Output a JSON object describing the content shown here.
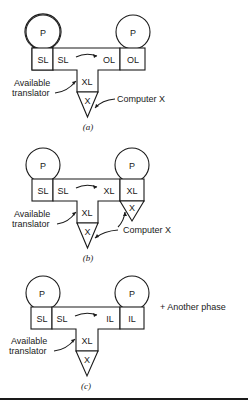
{
  "figures": [
    {
      "id": "a",
      "caption": "(a)",
      "left_machine": {
        "processor": "P",
        "language": "SL"
      },
      "translator_box": {
        "input": "SL",
        "output": "OL"
      },
      "right_machine": {
        "processor": "P",
        "language": "OL"
      },
      "stem": {
        "language": "XL",
        "machine": "X"
      },
      "annotations": {
        "available_translator": [
          "Available",
          "translator"
        ],
        "computer_x": "Computer  X"
      }
    },
    {
      "id": "b",
      "caption": "(b)",
      "left_machine": {
        "processor": "P",
        "language": "SL"
      },
      "translator_box": {
        "input": "SL",
        "output": "XL"
      },
      "right_machine": {
        "processor": "P",
        "language": "XL",
        "machine": "X"
      },
      "stem": {
        "language": "XL",
        "machine": "X"
      },
      "annotations": {
        "available_translator": [
          "Available",
          "translator"
        ],
        "computer_x": "Computer X"
      }
    },
    {
      "id": "c",
      "caption": "(c)",
      "left_machine": {
        "processor": "P",
        "language": "SL"
      },
      "translator_box": {
        "input": "SL",
        "output": "IL"
      },
      "right_machine": {
        "processor": "P",
        "language": "IL"
      },
      "stem": {
        "language": "XL",
        "machine": "X"
      },
      "annotations": {
        "available_translator": [
          "Available",
          "translator"
        ],
        "another_phase": "+ Another phase"
      }
    }
  ]
}
